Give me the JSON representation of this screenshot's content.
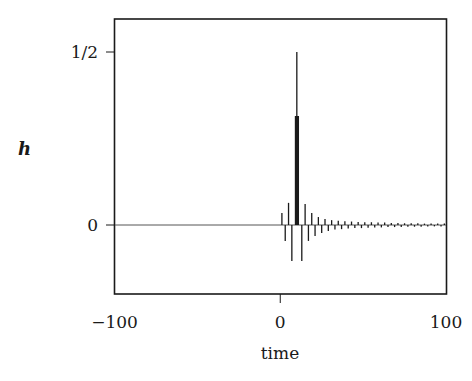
{
  "chart_data": {
    "type": "line",
    "title": "",
    "xlabel": "time",
    "ylabel": "h",
    "xlim": [
      -100,
      100
    ],
    "ylim": [
      -0.2,
      0.595
    ],
    "grid": false,
    "legend": null,
    "x_ticks": [
      {
        "value": -100,
        "label": "−100"
      },
      {
        "value": 0,
        "label": "0"
      },
      {
        "value": 100,
        "label": "100"
      }
    ],
    "y_ticks": [
      {
        "value": 0,
        "label": "0"
      },
      {
        "value": 0.5,
        "label": "1/2"
      }
    ],
    "series": [
      {
        "name": "h (impulse response, stem plot)",
        "style": "stems",
        "x": [
          1,
          3,
          5,
          7,
          10,
          13,
          15,
          17,
          19,
          21,
          23,
          25,
          27,
          29,
          31,
          33,
          35,
          37,
          39,
          41,
          43,
          45,
          47,
          49,
          51,
          53,
          55,
          57,
          59,
          61,
          63,
          65,
          67,
          69,
          71,
          73,
          75,
          77,
          79,
          81,
          83,
          85,
          87,
          89,
          91,
          93,
          95,
          97,
          99
        ],
        "values": [
          0.035,
          -0.046,
          0.064,
          -0.104,
          0.5,
          -0.104,
          0.061,
          -0.046,
          0.035,
          -0.032,
          0.023,
          -0.023,
          0.017,
          -0.017,
          0.014,
          -0.013,
          0.012,
          -0.012,
          0.011,
          -0.01,
          0.01,
          -0.009,
          0.009,
          -0.009,
          0.008,
          -0.008,
          0.008,
          -0.007,
          0.007,
          -0.007,
          0.007,
          -0.006,
          0.006,
          -0.006,
          0.006,
          -0.006,
          0.005,
          -0.005,
          0.005,
          -0.005,
          0.005,
          -0.005,
          0.004,
          -0.004,
          0.004,
          -0.004,
          0.004,
          -0.004,
          0.004
        ]
      },
      {
        "name": "h (thick central bar)",
        "style": "bar",
        "x": [
          10
        ],
        "values": [
          0.315
        ]
      }
    ]
  },
  "colors": {
    "ink": "#1a1a1a",
    "background": "#ffffff"
  }
}
